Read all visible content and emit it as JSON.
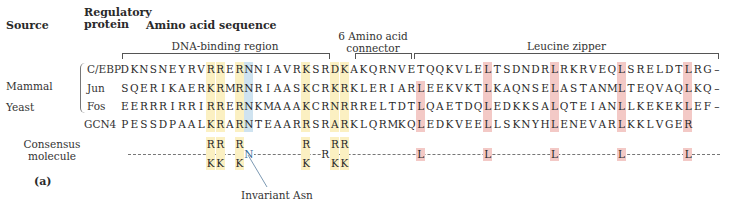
{
  "headers": {
    "source": "Source",
    "regulatory_protein_line1": "Regulatory",
    "regulatory_protein_line2": "protein",
    "amino_acid_sequence": "Amino acid sequence"
  },
  "regions": {
    "dna_binding": "DNA-binding region",
    "connector_line1": "6 Amino acid",
    "connector_line2": "connector",
    "leucine_zipper": "Leucine zipper"
  },
  "sources": {
    "mammal": "Mammal",
    "yeast": "Yeast"
  },
  "proteins": [
    {
      "name": "C/EBP",
      "sequence": "DKNSNEYRVRRERNNIAVRKSRDKAKQRNVETQQKVLELTSDNDRLRKRVEQLSRELDTLRG–"
    },
    {
      "name": "Jun",
      "sequence": "SQERIKAERKRMRNRIAASKCRKRKLERIARLEEKVKTLKAQNSELASTANMLTEQVAQLKQ–"
    },
    {
      "name": "Fos",
      "sequence": "EERRRIRRIRRERNKMAAAKCRNRRRELTDTLQAETDQLEDKKSALQTEIANLLKEKEKLEF–"
    },
    {
      "name": "GCN4",
      "sequence": "PESSDPAALKRARNTEAARRSRARKLQRMKQLEDKVEELLSKNYHLENEVARLKKLVGER"
    }
  ],
  "highlights": {
    "basic_columns": [
      9,
      10,
      12,
      19,
      22,
      23
    ],
    "asn_column": 13,
    "leucine_columns": [
      31,
      38,
      45,
      52,
      59
    ],
    "colors": {
      "basic": "#fbf0c2",
      "asn": "#cfe3f0",
      "leucine": "#f3c9c6"
    }
  },
  "consensus": {
    "label_line1": "Consensus",
    "label_line2": "molecule",
    "residues": [
      {
        "col": 9,
        "top": "R",
        "bottom": "K"
      },
      {
        "col": 10,
        "top": "R",
        "bottom": "K"
      },
      {
        "col": 12,
        "top": "R",
        "bottom": "K"
      },
      {
        "col": 13,
        "mid": "N"
      },
      {
        "col": 19,
        "top": "R",
        "bottom": "K"
      },
      {
        "col": 21,
        "mid": "R"
      },
      {
        "col": 22,
        "top": "R",
        "bottom": "K"
      },
      {
        "col": 23,
        "top": "R",
        "bottom": "K"
      },
      {
        "col": 31,
        "mid": "L"
      },
      {
        "col": 38,
        "mid": "L"
      },
      {
        "col": 45,
        "mid": "L"
      },
      {
        "col": 52,
        "mid": "L"
      },
      {
        "col": 59,
        "mid": "L"
      }
    ]
  },
  "annotations": {
    "invariant_asn": "Invariant Asn",
    "panel_label": "(a)"
  }
}
